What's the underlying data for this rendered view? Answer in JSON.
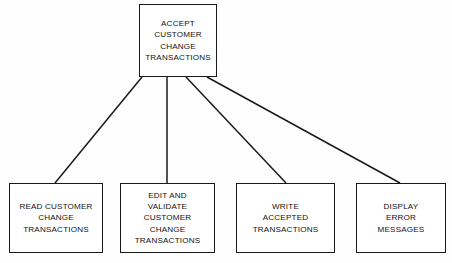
{
  "diagram": {
    "type": "structure-chart",
    "background_color": "#fefefe",
    "line_color": "#1a1a1a",
    "box_border_color": "#1a1a1a",
    "box_fill_color": "#ffffff",
    "root": {
      "id": "accept-customer-change-transactions",
      "label": "ACCEPT\nCUSTOMER\nCHANGE\nTRANSACTIONS"
    },
    "children": [
      {
        "id": "read-customer-change-transactions",
        "label": "READ CUSTOMER\nCHANGE\nTRANSACTIONS"
      },
      {
        "id": "edit-and-validate-customer-change-transactions",
        "label": "EDIT AND\nVALIDATE\nCUSTOMER\nCHANGE\nTRANSACTIONS"
      },
      {
        "id": "write-accepted-transactions",
        "label": "WRITE\nACCEPTED\nTRANSACTIONS"
      },
      {
        "id": "display-error-messages",
        "label": "DISPLAY\nERROR\nMESSAGES"
      }
    ],
    "connectors": [
      {
        "id": "connector-root-to-read",
        "x1": 142,
        "y1": 77,
        "x2": 55,
        "y2": 183
      },
      {
        "id": "connector-root-to-edit",
        "x1": 167,
        "y1": 77,
        "x2": 167,
        "y2": 183
      },
      {
        "id": "connector-root-to-write",
        "x1": 186,
        "y1": 77,
        "x2": 286,
        "y2": 183
      },
      {
        "id": "connector-root-to-display",
        "x1": 207,
        "y1": 77,
        "x2": 400,
        "y2": 183
      }
    ]
  }
}
